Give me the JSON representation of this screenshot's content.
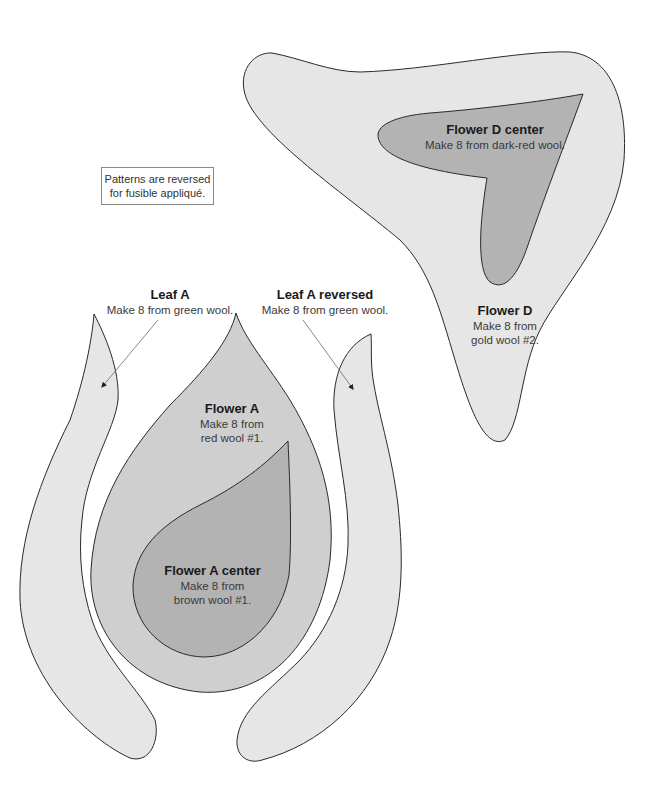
{
  "note": {
    "line1": "Patterns are reversed",
    "line2": "for fusible appliqué."
  },
  "pieces": {
    "flower_d_center": {
      "title": "Flower D center",
      "line1": "Make 8 from dark-red wool."
    },
    "flower_d": {
      "title": "Flower D",
      "line1": "Make 8 from",
      "line2": "gold wool #2."
    },
    "leaf_a": {
      "title": "Leaf A",
      "line1": "Make 8 from green wool."
    },
    "leaf_a_reversed": {
      "title": "Leaf A reversed",
      "line1": "Make 8 from green wool."
    },
    "flower_a": {
      "title": "Flower A",
      "line1": "Make 8 from",
      "line2": "red wool #1."
    },
    "flower_a_center": {
      "title": "Flower A center",
      "line1": "Make 8 from",
      "line2": "brown wool #1."
    }
  },
  "colors": {
    "light_fill": "#e6e6e6",
    "medium_fill": "#cfcfcf",
    "dark_fill": "#b3b3b3",
    "outline": "#2a2a2a",
    "arrow": "#6a6a6a"
  }
}
